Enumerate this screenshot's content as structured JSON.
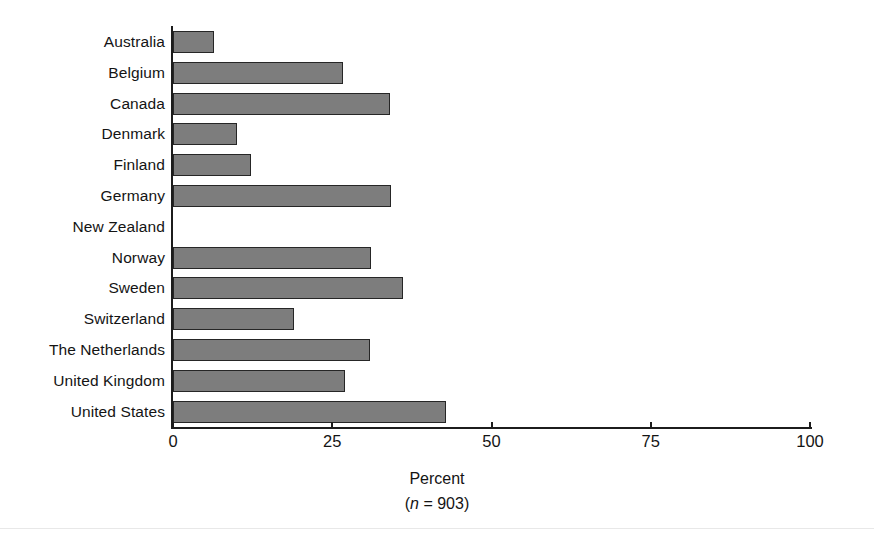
{
  "chart_data": {
    "type": "bar",
    "orientation": "horizontal",
    "title": "",
    "subtitle": "",
    "xlabel": "Percent",
    "xlabel_note": "(n = 903)",
    "note_italic_symbol": "n",
    "note_rest": " = 903)",
    "note_open": "(",
    "ylabel": "",
    "xlim": [
      0,
      100
    ],
    "xticks": [
      0,
      25,
      50,
      75,
      100
    ],
    "xtick_labels": [
      "0",
      "25",
      "50",
      "75",
      "100"
    ],
    "grid": false,
    "legend": "none",
    "categories": [
      "Australia",
      "Belgium",
      "Canada",
      "Denmark",
      "Finland",
      "Germany",
      "New Zealand",
      "Norway",
      "Sweden",
      "Switzerland",
      "The Netherlands",
      "United Kingdom",
      "United States"
    ],
    "values": [
      6.4,
      26.7,
      34.1,
      10.0,
      12.2,
      34.2,
      0,
      31.1,
      36.1,
      19.0,
      30.9,
      27.0,
      42.9
    ],
    "bar_fill_color": "#7d7d7d",
    "bar_edge_color": "#262626",
    "axis_color": "#1c1c1c",
    "background_color": "#ffffff"
  }
}
